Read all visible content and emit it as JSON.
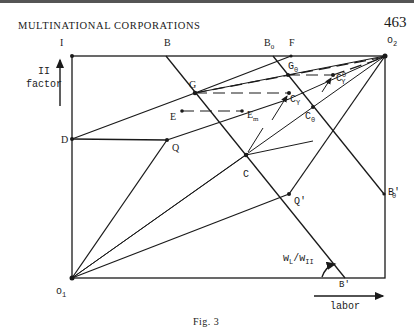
{
  "page": {
    "running_header": "MULTINATIONAL CORPORATIONS",
    "page_number": "463",
    "caption": "Fig. 3"
  },
  "axes": {
    "vertical_label_line1": "II",
    "vertical_label_line2": "factor",
    "horizontal_label": "labor",
    "angle_label": "wL/wII"
  },
  "points": {
    "I": "I",
    "B": "B",
    "B0": "B",
    "B0_sub": "0",
    "F": "F",
    "O2": "o",
    "O2_sub": "2",
    "G": "G",
    "G0": "G",
    "G0_sub": "0",
    "CY0": "C",
    "CY0_sup": "0",
    "CY0_sub": "Y",
    "CY": "C",
    "CY_sub": "Y",
    "E": "E",
    "Em": "E",
    "Em_sub": "m",
    "C0": "C",
    "C0_sub": "0",
    "D": "D",
    "Q": "Q",
    "C": "C",
    "Qp": "Q'",
    "B0p": "B'",
    "B0p_sub": "0",
    "O1": "o",
    "O1_sub": "1",
    "Bp": "B'"
  },
  "angle_label": {
    "w1": "w",
    "s1": "L",
    "slash": "/",
    "w2": "w",
    "s2": "II"
  },
  "colors": {
    "ink": "#1a1a1a",
    "paper": "#ffffff"
  }
}
